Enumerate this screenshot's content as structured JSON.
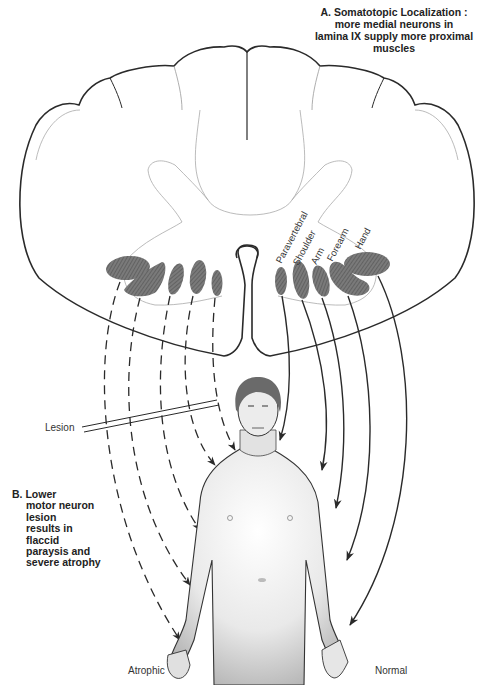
{
  "annotations": {
    "a": {
      "lines": [
        "A. Somatotopic Localization :",
        "more medial neurons in",
        "lamina IX supply more proximal",
        "muscles"
      ]
    },
    "b": {
      "lines": [
        "B. Lower",
        "motor neuron",
        "lesion",
        "results in",
        "flaccid",
        "paraysis and",
        "severe atrophy"
      ]
    }
  },
  "nucleus_labels": [
    "Paravertebral",
    "Shoulder",
    "Arm",
    "Forearm",
    "Hand"
  ],
  "labels": {
    "lesion": "Lesion",
    "atrophic": "Atrophic",
    "normal": "Normal"
  },
  "colors": {
    "outline": "#2a2a2a",
    "nucleus_fill": "#6e6e6e",
    "skin": "#d9d9d9",
    "hair": "#6a6a6a"
  }
}
